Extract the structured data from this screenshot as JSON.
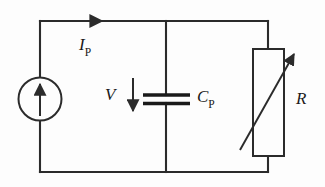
{
  "figure": {
    "background_color": "#fdfdfd",
    "line_color": "#2b2b2b",
    "text_color": "#1a1a1a"
  },
  "labels": {
    "current": {
      "symbol": "I",
      "subscript": "P",
      "full": "I_P"
    },
    "voltage": {
      "symbol": "V",
      "subscript": "",
      "full": "V"
    },
    "capacitor": {
      "symbol": "C",
      "subscript": "P",
      "full": "C_P"
    },
    "resistor": {
      "symbol": "R",
      "subscript": "",
      "full": "R"
    }
  },
  "components": [
    {
      "name": "current-source",
      "type": "current-source",
      "label": "",
      "direction": "up"
    },
    {
      "name": "capacitor",
      "type": "capacitor",
      "label": "C_P"
    },
    {
      "name": "variable-resistor",
      "type": "variable-resistor",
      "label": "R"
    }
  ],
  "annotations": [
    {
      "name": "current-arrow",
      "label": "I_P",
      "direction": "right"
    },
    {
      "name": "voltage-arrow",
      "label": "V",
      "direction": "down"
    },
    {
      "name": "variability-arrow",
      "label": "",
      "direction": "diagonal-up-right"
    }
  ]
}
